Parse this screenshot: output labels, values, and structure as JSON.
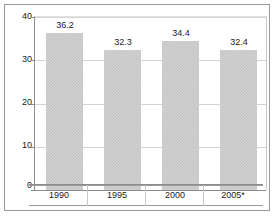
{
  "chart_data": {
    "type": "bar",
    "title": "",
    "xlabel": "",
    "ylabel": "",
    "categories": [
      "1990",
      "1995",
      "2000",
      "2005*"
    ],
    "values": [
      36.2,
      32.3,
      34.4,
      32.4
    ],
    "value_labels": [
      "36.2",
      "32.3",
      "34.4",
      "32.4"
    ],
    "ylim": [
      0,
      40
    ],
    "yticks": [
      0,
      10,
      20,
      30,
      40
    ],
    "ytick_labels": [
      "0",
      "10",
      "20",
      "30",
      "40"
    ],
    "grid": true,
    "legend": false,
    "bar_fill": "#d2d2d2",
    "bar_pattern": "fine-checkerboard-dither",
    "axis_color": "#8c8c8c",
    "gridline_color": "#d3d3d3",
    "frame_color": "#9a9a9a",
    "text_color": "#1a1a1a",
    "background": "#ffffff",
    "footnote_marker": "*"
  }
}
